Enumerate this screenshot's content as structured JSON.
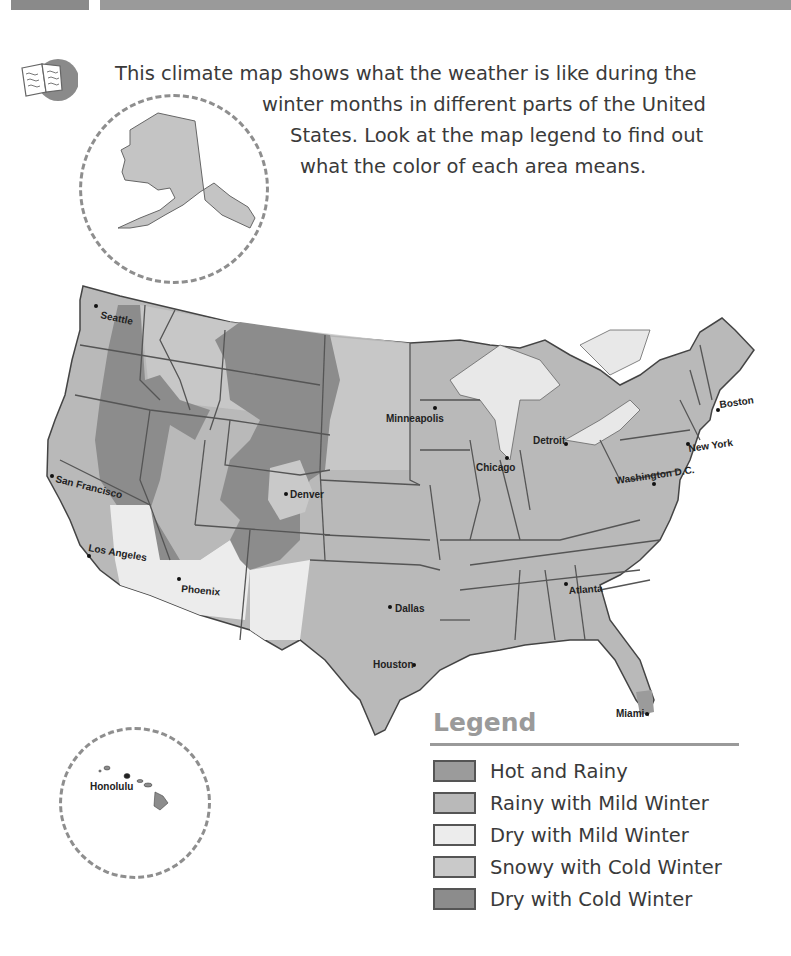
{
  "header": {
    "bar_colors": [
      "#8a8a8a",
      "#9a9a9a"
    ]
  },
  "intro": {
    "icon": "open-book-icon",
    "lines": [
      "This climate map shows what the weather is like during the",
      "winter months in different parts of the United",
      "States. Look at the map legend to find out",
      "what the color of each area means."
    ]
  },
  "map": {
    "title": "United States Winter Climate Map",
    "insets": [
      {
        "name": "Alaska",
        "label": ""
      },
      {
        "name": "Hawaii",
        "label": "Honolulu"
      }
    ],
    "cities": [
      {
        "name": "Seattle",
        "x": 108,
        "y": 307
      },
      {
        "name": "San Francisco",
        "x": 53,
        "y": 475
      },
      {
        "name": "Los Angeles",
        "x": 91,
        "y": 556
      },
      {
        "name": "Phoenix",
        "x": 180,
        "y": 579
      },
      {
        "name": "Denver",
        "x": 286,
        "y": 495
      },
      {
        "name": "Minneapolis",
        "x": 435,
        "y": 410
      },
      {
        "name": "Chicago",
        "x": 507,
        "y": 458
      },
      {
        "name": "Detroit",
        "x": 566,
        "y": 444
      },
      {
        "name": "Boston",
        "x": 717,
        "y": 410
      },
      {
        "name": "New York",
        "x": 688,
        "y": 444
      },
      {
        "name": "Washington D.C.",
        "x": 654,
        "y": 484
      },
      {
        "name": "Atlanta",
        "x": 566,
        "y": 584
      },
      {
        "name": "Dallas",
        "x": 390,
        "y": 607
      },
      {
        "name": "Houston",
        "x": 414,
        "y": 664
      },
      {
        "name": "Miami",
        "x": 646,
        "y": 714
      }
    ]
  },
  "legend": {
    "title": "Legend",
    "items": [
      {
        "label": "Hot and Rainy",
        "color": "#9b9b9b"
      },
      {
        "label": "Rainy with Mild Winter",
        "color": "#b9b9b9"
      },
      {
        "label": "Dry with Mild Winter",
        "color": "#ececec"
      },
      {
        "label": "Snowy with Cold Winter",
        "color": "#c9c9c9"
      },
      {
        "label": "Dry with Cold Winter",
        "color": "#8c8c8c"
      }
    ]
  }
}
